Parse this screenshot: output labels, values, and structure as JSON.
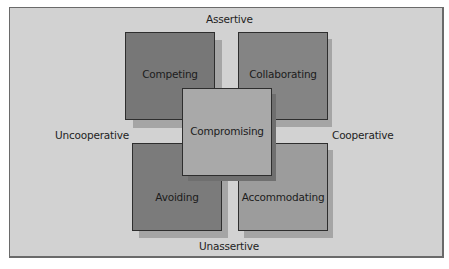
{
  "diagram": {
    "axes": {
      "top": "Assertive",
      "bottom": "Unassertive",
      "left": "Uncooperative",
      "right": "Cooperative"
    },
    "styles": [
      {
        "id": "competing",
        "label": "Competing",
        "color": "#777777"
      },
      {
        "id": "collaborating",
        "label": "Collaborating",
        "color": "#848484"
      },
      {
        "id": "compromising",
        "label": "Compromising",
        "color": "#a9a9a9"
      },
      {
        "id": "avoiding",
        "label": "Avoiding",
        "color": "#7b7b7b"
      },
      {
        "id": "accommodating",
        "label": "Accommodating",
        "color": "#9c9c9c"
      }
    ],
    "colors": {
      "background": "#d2d2d2",
      "border": "#6a6a6a"
    }
  }
}
